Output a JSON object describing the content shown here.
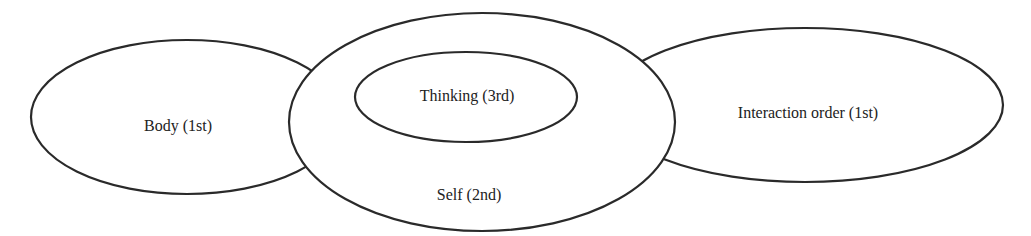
{
  "diagram": {
    "type": "overlapping-ellipses",
    "nodes": [
      {
        "id": "body",
        "label": "Body (1st)"
      },
      {
        "id": "self",
        "label": "Self (2nd)"
      },
      {
        "id": "thinking",
        "label": "Thinking (3rd)"
      },
      {
        "id": "interaction",
        "label": "Interaction order (1st)"
      }
    ],
    "relations": [
      {
        "from": "thinking",
        "to": "self",
        "type": "nested-inside"
      },
      {
        "from": "body",
        "to": "self",
        "type": "overlaps"
      },
      {
        "from": "interaction",
        "to": "self",
        "type": "overlaps"
      }
    ],
    "colors": {
      "stroke": "#2a2a2a",
      "fill": "#ffffff",
      "text": "#222222"
    }
  }
}
